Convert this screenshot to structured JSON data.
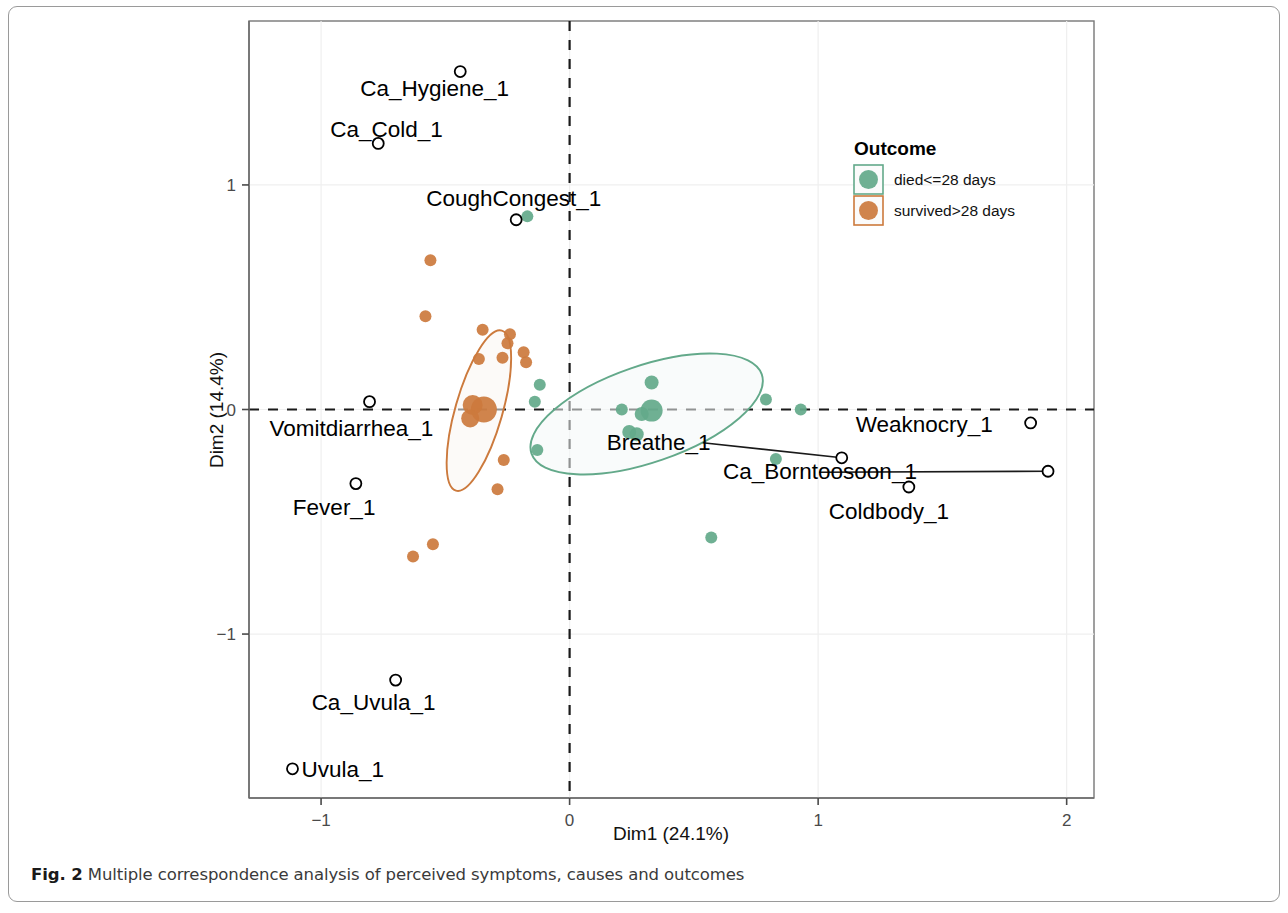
{
  "figure": {
    "caption_lead": "Fig. 2",
    "caption_text": "Multiple correspondence analysis of perceived symptoms, causes and outcomes"
  },
  "legend": {
    "title": "Outcome",
    "items": [
      {
        "label": "died<=28 days",
        "color": "#63a98a"
      },
      {
        "label": "survived>28 days",
        "color": "#cc7a3d"
      }
    ]
  },
  "chart_data": {
    "type": "scatter",
    "title": "",
    "xlabel": "Dim1 (24.1%)",
    "ylabel": "Dim2 (14.4%)",
    "xlim": [
      -1.29,
      2.11
    ],
    "ylim": [
      -1.73,
      1.73
    ],
    "xticks": [
      -1,
      0,
      1,
      2
    ],
    "xticklabels": [
      "−1",
      "0",
      "1",
      "2"
    ],
    "yticks": [
      1,
      0,
      -1
    ],
    "yticklabels": [
      "1",
      "0",
      "−1"
    ],
    "grid": true,
    "reference_lines": {
      "vertical_x": 0,
      "horizontal_y": 0,
      "style": "dashed"
    },
    "legend_position": "upper-right-inside",
    "series": [
      {
        "name": "died<=28 days",
        "color": "#63a98a",
        "marker": "filled-circle",
        "points": [
          {
            "x": -0.17,
            "y": 0.86,
            "r": 6
          },
          {
            "x": -0.12,
            "y": 0.11,
            "r": 6
          },
          {
            "x": -0.14,
            "y": 0.035,
            "r": 6
          },
          {
            "x": -0.13,
            "y": -0.18,
            "r": 6
          },
          {
            "x": 0.33,
            "y": 0.12,
            "r": 7
          },
          {
            "x": 0.21,
            "y": 0.0,
            "r": 6
          },
          {
            "x": 0.33,
            "y": -0.005,
            "r": 11
          },
          {
            "x": 0.29,
            "y": -0.02,
            "r": 7
          },
          {
            "x": 0.24,
            "y": -0.1,
            "r": 7
          },
          {
            "x": 0.27,
            "y": -0.11,
            "r": 7
          },
          {
            "x": 0.79,
            "y": 0.045,
            "r": 6
          },
          {
            "x": 0.93,
            "y": 0.0,
            "r": 6
          },
          {
            "x": 0.83,
            "y": -0.22,
            "r": 6
          },
          {
            "x": 0.57,
            "y": -0.57,
            "r": 6
          }
        ],
        "ellipse": {
          "cx": 0.31,
          "cy": -0.02,
          "rx": 0.49,
          "ry": 0.215,
          "rotation": -19,
          "stroke": "#63a98a",
          "fill": "#f4f8f7"
        }
      },
      {
        "name": "survived>28 days",
        "color": "#cc7a3d",
        "marker": "filled-circle",
        "points": [
          {
            "x": -0.56,
            "y": 0.665,
            "r": 6
          },
          {
            "x": -0.58,
            "y": 0.415,
            "r": 6
          },
          {
            "x": -0.35,
            "y": 0.355,
            "r": 6
          },
          {
            "x": -0.24,
            "y": 0.335,
            "r": 6
          },
          {
            "x": -0.25,
            "y": 0.295,
            "r": 6
          },
          {
            "x": -0.27,
            "y": 0.23,
            "r": 6
          },
          {
            "x": -0.185,
            "y": 0.255,
            "r": 6
          },
          {
            "x": -0.175,
            "y": 0.21,
            "r": 6
          },
          {
            "x": -0.365,
            "y": 0.225,
            "r": 6
          },
          {
            "x": -0.39,
            "y": 0.02,
            "r": 10
          },
          {
            "x": -0.345,
            "y": 0.0,
            "r": 13
          },
          {
            "x": -0.4,
            "y": -0.04,
            "r": 9
          },
          {
            "x": -0.265,
            "y": -0.225,
            "r": 6
          },
          {
            "x": -0.29,
            "y": -0.355,
            "r": 6
          },
          {
            "x": -0.55,
            "y": -0.6,
            "r": 6
          },
          {
            "x": -0.63,
            "y": -0.655,
            "r": 6
          }
        ],
        "ellipse": {
          "cx": -0.365,
          "cy": -0.005,
          "rx": 0.335,
          "ry": 0.105,
          "rotation": -74,
          "stroke": "#cc7a3d",
          "fill": "#f9f6f3"
        }
      }
    ],
    "variable_points": {
      "marker": "open-circle",
      "color": "#000000",
      "items": [
        {
          "label": "Ca_Hygiene_1",
          "x": -0.44,
          "y": 1.505,
          "label_dx": -100,
          "label_dy": 24,
          "leader": false
        },
        {
          "label": "Ca_Cold_1",
          "x": -0.77,
          "y": 1.185,
          "label_dx": -48,
          "label_dy": -6,
          "leader": false
        },
        {
          "label": "CoughCongest_1",
          "x": -0.215,
          "y": 0.845,
          "label_dx": -90,
          "label_dy": -14,
          "leader": false
        },
        {
          "label": "Vomitdiarrhea_1",
          "x": -0.805,
          "y": 0.035,
          "label_dx": -100,
          "label_dy": 34,
          "leader": false
        },
        {
          "label": "Fever_1",
          "x": -0.86,
          "y": -0.33,
          "label_dx": -63,
          "label_dy": 31,
          "leader": false
        },
        {
          "label": "Ca_Uvula_1",
          "x": -0.7,
          "y": -1.205,
          "label_dx": -84,
          "label_dy": 30,
          "leader": false
        },
        {
          "label": "Uvula_1",
          "x": -1.115,
          "y": -1.6,
          "label_dx": 9,
          "label_dy": 8,
          "leader": false
        },
        {
          "label": "Breathe_1",
          "x": 1.095,
          "y": -0.215,
          "label_dx": -235,
          "label_dy": -8,
          "leader": true
        },
        {
          "label": "Weaknocry_1",
          "x": 1.855,
          "y": -0.06,
          "label_dx": -175,
          "label_dy": 9,
          "leader": false
        },
        {
          "label": "Ca_Borntoosoon_1",
          "x": 1.925,
          "y": -0.275,
          "label_dx": -325,
          "label_dy": 8,
          "leader": true
        },
        {
          "label": "Coldbody_1",
          "x": 1.365,
          "y": -0.345,
          "label_dx": -80,
          "label_dy": 32,
          "leader": false
        }
      ]
    }
  }
}
